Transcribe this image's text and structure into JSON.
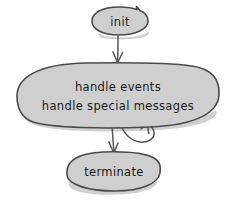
{
  "diagram": {
    "type": "flowchart",
    "style": "hand-drawn-sketch",
    "background_color": "#ffffff",
    "node_fill_color": "#cfcfcf",
    "node_stroke_color": "#4a4a4a",
    "edge_color": "#555555",
    "text_color": "#1a1a1a",
    "nodes": [
      {
        "id": "init",
        "label": "init",
        "shape": "ellipse"
      },
      {
        "id": "handle",
        "label_line1": "handle events",
        "label_line2": "handle special messages",
        "shape": "ellipse"
      },
      {
        "id": "terminate",
        "label": "terminate",
        "shape": "ellipse"
      }
    ],
    "edges": [
      {
        "id": "init-to-handle",
        "from": "init",
        "to": "handle",
        "label": "",
        "kind": "straight-arrow"
      },
      {
        "id": "handle-to-terminate",
        "from": "handle",
        "to": "terminate",
        "label": "",
        "kind": "straight-arrow"
      },
      {
        "id": "handle-self-loop",
        "from": "handle",
        "to": "handle",
        "label": "",
        "kind": "self-loop-arrow"
      }
    ]
  }
}
